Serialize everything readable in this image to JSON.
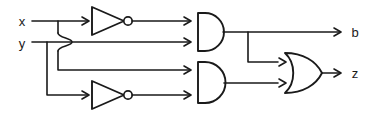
{
  "diagram": {
    "background_color": "#ffffff",
    "line_color": "#1a1a1a",
    "inputs": [
      {
        "id": "x",
        "label": "x",
        "x": 22,
        "y": 26
      },
      {
        "id": "y",
        "label": "y",
        "x": 22,
        "y": 48
      }
    ],
    "outputs": [
      {
        "id": "b",
        "label": "b",
        "x": 355,
        "y": 27
      },
      {
        "id": "z",
        "label": "z",
        "x": 355,
        "y": 78
      }
    ],
    "gates": [
      {
        "id": "inv1",
        "type": "not-gate",
        "label": "NOT",
        "input": "x",
        "output": "not-x"
      },
      {
        "id": "inv2",
        "type": "not-gate",
        "label": "NOT",
        "input": "y",
        "output": "not-y"
      },
      {
        "id": "and1",
        "type": "and-gate",
        "label": "AND",
        "inputs": [
          "not-x",
          "y"
        ],
        "output": "b"
      },
      {
        "id": "and2",
        "type": "and-gate",
        "label": "AND",
        "inputs": [
          "x",
          "not-y"
        ],
        "output": "and2-out"
      },
      {
        "id": "or1",
        "type": "or-gate",
        "label": "OR",
        "inputs": [
          "b",
          "and2-out"
        ],
        "output": "z"
      }
    ],
    "nets": [
      {
        "id": "net-x",
        "from": "x",
        "to": "inv1"
      },
      {
        "id": "net-x-branch",
        "from": "x",
        "to": "and2"
      },
      {
        "id": "net-y",
        "from": "y",
        "to": "and1"
      },
      {
        "id": "net-y-branch",
        "from": "y",
        "to": "inv2"
      },
      {
        "id": "net-b",
        "from": "and1",
        "to": "b"
      },
      {
        "id": "net-b-branch",
        "from": "and1",
        "to": "or1"
      },
      {
        "id": "net-and2",
        "from": "and2",
        "to": "or1"
      },
      {
        "id": "net-z",
        "from": "or1",
        "to": "z"
      }
    ],
    "crossover": {
      "type": "wire-hop",
      "x": 67,
      "y": 42,
      "note": "x wire hops over y wire"
    }
  }
}
